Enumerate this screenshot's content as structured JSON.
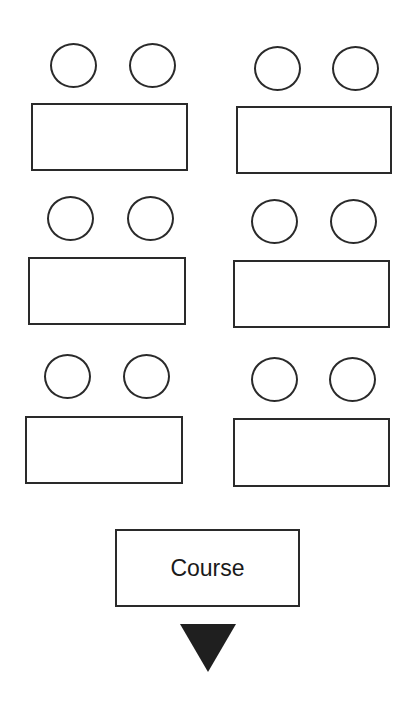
{
  "diagram": {
    "type": "classroom-seating-layout",
    "groups": [
      {
        "row": 1,
        "column": "left",
        "seats": 2
      },
      {
        "row": 1,
        "column": "right",
        "seats": 2
      },
      {
        "row": 2,
        "column": "left",
        "seats": 2
      },
      {
        "row": 2,
        "column": "right",
        "seats": 2
      },
      {
        "row": 3,
        "column": "left",
        "seats": 2
      },
      {
        "row": 3,
        "column": "right",
        "seats": 2
      }
    ],
    "front_box": {
      "label": "Course"
    },
    "direction_marker": "down-triangle",
    "colors": {
      "stroke": "#2a2a2a",
      "arrow": "#1f1f1f",
      "background": "#ffffff"
    }
  }
}
